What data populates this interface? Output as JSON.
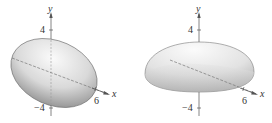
{
  "figures": [
    {
      "id": "left",
      "shape": "tilted ellipsoid",
      "axes": {
        "y_label": "y",
        "x_label": "x",
        "y_ticks": [
          "4",
          "−4"
        ],
        "x_ticks": [
          "6"
        ]
      }
    },
    {
      "id": "right",
      "shape": "flattened ellipsoid (dome)",
      "axes": {
        "y_label": "y",
        "x_label": "x",
        "y_ticks": [
          "4",
          "−4"
        ],
        "x_ticks": [
          "6"
        ]
      }
    }
  ],
  "colors": {
    "surface_light": "#f2f2f2",
    "surface_dark": "#8c8c8c",
    "axis": "#555555",
    "text": "#333333"
  }
}
